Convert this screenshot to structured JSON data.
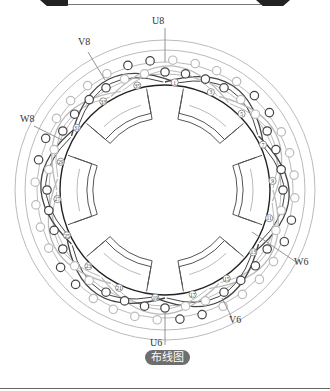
{
  "caption": "布线图",
  "phase_labels": [
    {
      "text": "U8",
      "x": 152,
      "y": 26
    },
    {
      "text": "V8",
      "x": 78,
      "y": 47
    },
    {
      "text": "W8",
      "x": 20,
      "y": 124
    },
    {
      "text": "U6",
      "x": 150,
      "y": 348
    },
    {
      "text": "V6",
      "x": 229,
      "y": 325
    },
    {
      "text": "W6",
      "x": 294,
      "y": 267
    }
  ],
  "slot_numbers": [
    "1",
    "3",
    "5",
    "7",
    "9",
    "11",
    "13",
    "15",
    "17",
    "19",
    "21",
    "23",
    "25",
    "27",
    "29",
    "31",
    "33",
    "35"
  ],
  "colors": {
    "dark_coil": "#444444",
    "light_coil": "#bbbbbb",
    "inner_ring": "#222222",
    "caption_bg": "#6e6e6e"
  },
  "geometry": {
    "cx": 165,
    "cy": 190,
    "outer_radius": 150,
    "inner_ring_radius": 105,
    "bore_radius": 68,
    "slots": 36
  }
}
